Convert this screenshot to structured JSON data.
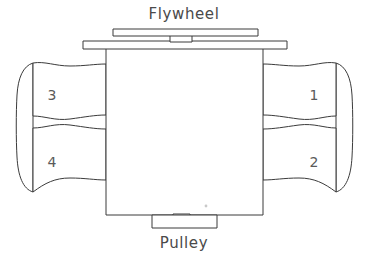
{
  "diagram": {
    "background_color": "#ffffff",
    "line_color": "#3b3b3b",
    "text_color": "#4a4a4a",
    "labels": {
      "flywheel": "Flywheel",
      "pulley": "Pulley"
    },
    "cylinders": [
      {
        "number": "1",
        "bank": "right",
        "position": "top",
        "x": 313,
        "y": 95
      },
      {
        "number": "2",
        "bank": "right",
        "position": "bottom",
        "x": 313,
        "y": 165
      },
      {
        "number": "3",
        "bank": "left",
        "position": "top",
        "x": 52,
        "y": 95
      },
      {
        "number": "4",
        "bank": "left",
        "position": "bottom",
        "x": 52,
        "y": 165
      }
    ],
    "parts": {
      "engine_block": "engine-block",
      "flywheel_bar": "flywheel-bar",
      "top_plate": "top-plate",
      "crank_shaft_stub_top": "crankshaft-stub-top",
      "crank_shaft_stub_bottom": "crankshaft-stub-bottom",
      "pulley_block": "pulley-block",
      "left_bank_cap": "left-bank-end-cap",
      "right_bank_cap": "right-bank-end-cap"
    }
  }
}
